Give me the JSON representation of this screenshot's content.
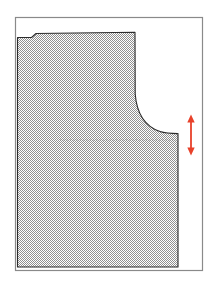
{
  "page": {
    "background_color": "#ffffff",
    "width": 219,
    "height": 287
  },
  "frame": {
    "name": "diagram-border",
    "stroke_color": "#8a8a8a",
    "stroke_width": 1.2,
    "x": 15.5,
    "y": 17.5,
    "width": 187,
    "height": 253,
    "fill": "#ffffff"
  },
  "pattern_piece": {
    "name": "bodice-pattern-piece",
    "fill_color": "#a8a8a8",
    "fill_style": "checkerboard-dither",
    "outline_color": "#2b2b2b",
    "outline_width": 1.1,
    "path": "M 17.5 267 L 17.5 37.5 L 31.5 37.5 L 36 33.5 L 135 32.2 L 135.2 94 C 136.6 112 144 126 160 131.6 C 165.5 133.4 171 133.6 178 133.6 L 178 267 Z",
    "description": "Shaded bodice front pattern with stepped top-left corner, sloping shoulder line, concave armhole curve, and straight right side seam"
  },
  "guide_line": {
    "name": "bust-level-guide-line",
    "style": "dotted",
    "color": "#7d7d7d",
    "x1": 60,
    "x2": 176,
    "y": 140
  },
  "measurement_arrow": {
    "name": "side-seam-length-arrow",
    "color": "#e8412a",
    "orientation": "vertical",
    "double_headed": true,
    "x": 191,
    "y_top": 117,
    "y_bottom": 153,
    "shaft_width": 1.8,
    "head_size": 4.2
  }
}
